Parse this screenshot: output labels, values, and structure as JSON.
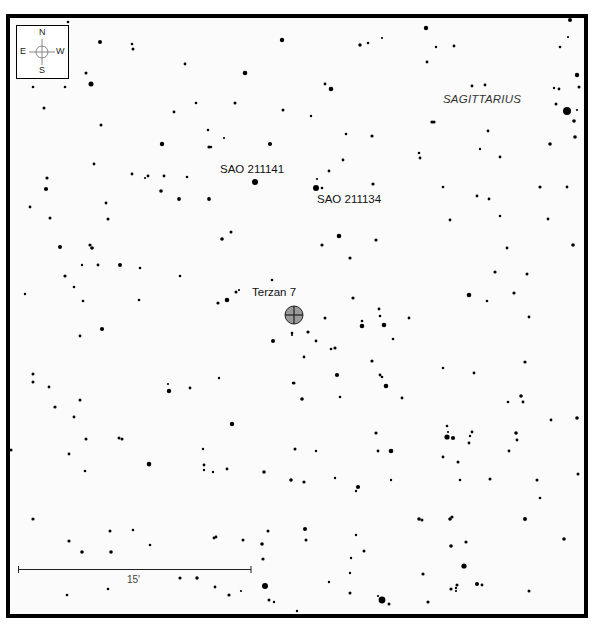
{
  "chart": {
    "constellation": "SAGITTARIUS",
    "target": {
      "name": "Terzan 7",
      "x": 294,
      "y": 315,
      "r": 9
    },
    "labels": [
      {
        "id": "sao-211141",
        "text": "SAO 211141",
        "x": 220,
        "y": 166
      },
      {
        "id": "sao-211134",
        "text": "SAO 211134",
        "x": 317,
        "y": 196
      },
      {
        "id": "terzan-7",
        "text": "Terzan 7",
        "x": 252,
        "y": 289
      }
    ],
    "constellation_label": {
      "x": 443,
      "y": 96
    },
    "compass": {
      "n": "N",
      "s": "S",
      "e": "E",
      "w": "W"
    },
    "scale": {
      "label": "15'",
      "x1": 18,
      "x2": 251,
      "y": 569
    },
    "colors": {
      "border": "#000000",
      "background": "#fbfbfb",
      "star": "#000000",
      "target_fill": "#9a9a9a"
    }
  },
  "stars": [
    [
      68,
      22,
      1.3
    ],
    [
      100,
      42,
      2
    ],
    [
      132,
      44,
      1.3
    ],
    [
      133,
      49,
      1.5
    ],
    [
      185,
      64,
      1.4
    ],
    [
      245,
      73,
      2.3
    ],
    [
      282,
      40,
      2.2
    ],
    [
      86,
      73,
      1.5
    ],
    [
      91,
      84,
      2.5
    ],
    [
      33,
      87,
      1.3
    ],
    [
      65,
      87,
      1.3
    ],
    [
      44,
      108,
      1.5
    ],
    [
      101,
      125,
      1.5
    ],
    [
      174,
      112,
      1.4
    ],
    [
      196,
      103,
      1.3
    ],
    [
      162,
      144,
      2.2
    ],
    [
      208,
      130,
      1.3
    ],
    [
      209,
      147,
      1.6
    ],
    [
      211,
      147,
      1.2
    ],
    [
      224,
      138,
      1.1
    ],
    [
      270,
      144,
      2
    ],
    [
      283,
      110,
      1.5
    ],
    [
      235,
      103,
      1.5
    ],
    [
      331,
      89,
      2.3
    ],
    [
      360,
      45,
      1.7
    ],
    [
      368,
      43,
      1.3
    ],
    [
      382,
      38,
      1.1
    ],
    [
      426,
      28,
      2.2
    ],
    [
      454,
      46,
      1.4
    ],
    [
      436,
      47,
      1.2
    ],
    [
      427,
      62,
      1.4
    ],
    [
      570,
      20,
      2
    ],
    [
      568,
      37,
      1.1
    ],
    [
      560,
      47,
      1.3
    ],
    [
      577,
      75,
      2.2
    ],
    [
      554,
      88,
      1.2
    ],
    [
      559,
      89,
      1.4
    ],
    [
      579,
      87,
      1.5
    ],
    [
      556,
      104,
      1.5
    ],
    [
      567,
      111,
      4
    ],
    [
      577,
      110,
      1.1
    ],
    [
      574,
      121,
      1.8
    ],
    [
      575,
      137,
      1.8
    ],
    [
      550,
      144,
      1.8
    ],
    [
      485,
      85,
      1.4
    ],
    [
      472,
      86,
      1.4
    ],
    [
      432,
      122,
      1.6
    ],
    [
      434,
      122,
      1.6
    ],
    [
      488,
      131,
      1.4
    ],
    [
      480,
      149,
      1.2
    ],
    [
      419,
      153,
      1.3
    ],
    [
      420,
      158,
      1.4
    ],
    [
      372,
      136,
      1.6
    ],
    [
      346,
      134,
      1.3
    ],
    [
      325,
      84,
      1.4
    ],
    [
      311,
      116,
      1.2
    ],
    [
      47,
      178,
      1.6
    ],
    [
      46,
      189,
      2.1
    ],
    [
      30,
      207,
      1.4
    ],
    [
      50,
      218,
      1.5
    ],
    [
      94,
      164,
      1.4
    ],
    [
      132,
      174,
      1.4
    ],
    [
      145,
      178,
      1.1
    ],
    [
      148,
      176,
      1.4
    ],
    [
      164,
      176,
      1.4
    ],
    [
      187,
      177,
      1.3
    ],
    [
      161,
      191,
      1.8
    ],
    [
      179,
      199,
      1.9
    ],
    [
      209,
      199,
      1.9
    ],
    [
      255,
      182,
      3
    ],
    [
      106,
      203,
      1.4
    ],
    [
      108,
      219,
      1.5
    ],
    [
      60,
      247,
      2
    ],
    [
      90,
      245,
      1.6
    ],
    [
      92,
      248,
      1.8
    ],
    [
      140,
      268,
      1.3
    ],
    [
      82,
      265,
      1.2
    ],
    [
      98,
      265,
      1.4
    ],
    [
      120,
      265,
      2
    ],
    [
      65,
      276,
      1.6
    ],
    [
      74,
      287,
      1.3
    ],
    [
      83,
      301,
      1.3
    ],
    [
      180,
      276,
      1.3
    ],
    [
      139,
      300,
      1.3
    ],
    [
      25,
      294,
      1.2
    ],
    [
      222,
      239,
      1.8
    ],
    [
      231,
      232,
      1.5
    ],
    [
      272,
      280,
      1.3
    ],
    [
      218,
      303,
      1.6
    ],
    [
      227,
      300,
      2.3
    ],
    [
      236,
      292,
      1.5
    ],
    [
      239,
      290,
      1.1
    ],
    [
      316,
      188,
      3
    ],
    [
      322,
      188,
      1.3
    ],
    [
      317,
      179,
      1.1
    ],
    [
      329,
      171,
      1.4
    ],
    [
      373,
      184,
      1.6
    ],
    [
      343,
      160,
      1.4
    ],
    [
      443,
      187,
      1.3
    ],
    [
      477,
      196,
      1.4
    ],
    [
      489,
      199,
      1.4
    ],
    [
      500,
      157,
      1.4
    ],
    [
      450,
      220,
      1.4
    ],
    [
      500,
      216,
      1.3
    ],
    [
      540,
      187,
      1.6
    ],
    [
      567,
      187,
      1.4
    ],
    [
      548,
      219,
      1.4
    ],
    [
      507,
      248,
      1.4
    ],
    [
      339,
      236,
      2.3
    ],
    [
      322,
      245,
      1.6
    ],
    [
      376,
      240,
      1.6
    ],
    [
      350,
      258,
      1.6
    ],
    [
      495,
      272,
      1.6
    ],
    [
      527,
      274,
      1.5
    ],
    [
      573,
      245,
      1.8
    ],
    [
      514,
      293,
      1.6
    ],
    [
      353,
      298,
      1.6
    ],
    [
      469,
      295,
      2.3
    ],
    [
      487,
      301,
      1.3
    ],
    [
      379,
      309,
      1.4
    ],
    [
      409,
      318,
      1.4
    ],
    [
      102,
      329,
      2.1
    ],
    [
      80,
      336,
      1.4
    ],
    [
      273,
      341,
      2
    ],
    [
      292,
      333,
      1.3
    ],
    [
      33,
      374,
      1.5
    ],
    [
      33,
      382,
      1.5
    ],
    [
      49,
      387,
      1.4
    ],
    [
      80,
      400,
      1.5
    ],
    [
      55,
      407,
      1.6
    ],
    [
      74,
      417,
      1.4
    ],
    [
      86,
      439,
      1.5
    ],
    [
      169,
      391,
      2.2
    ],
    [
      168,
      384,
      1.1
    ],
    [
      190,
      388,
      1.4
    ],
    [
      219,
      378,
      1.2
    ],
    [
      232,
      424,
      2.2
    ],
    [
      294,
      383,
      1.5
    ],
    [
      11,
      450,
      1.5
    ],
    [
      69,
      454,
      1.4
    ],
    [
      85,
      471,
      1.3
    ],
    [
      119,
      438,
      1.5
    ],
    [
      122,
      439,
      1.5
    ],
    [
      149,
      464,
      2.3
    ],
    [
      204,
      465,
      1.4
    ],
    [
      227,
      469,
      1.4
    ],
    [
      295,
      449,
      1.5
    ],
    [
      203,
      449,
      1.2
    ],
    [
      292,
      335,
      1.1
    ],
    [
      325,
      318,
      1.5
    ],
    [
      362,
      321,
      1.3
    ],
    [
      362,
      326,
      2.3
    ],
    [
      308,
      332,
      1.6
    ],
    [
      316,
      341,
      1.4
    ],
    [
      304,
      357,
      1.4
    ],
    [
      335,
      348,
      1.6
    ],
    [
      331,
      349,
      1.3
    ],
    [
      293,
      383,
      1.2
    ],
    [
      337,
      375,
      2.1
    ],
    [
      380,
      316,
      1.3
    ],
    [
      384,
      325,
      2.3
    ],
    [
      393,
      339,
      1.3
    ],
    [
      372,
      361,
      1.6
    ],
    [
      380,
      375,
      1.4
    ],
    [
      382,
      377,
      1.3
    ],
    [
      386,
      386,
      2.3
    ],
    [
      302,
      399,
      1.8
    ],
    [
      340,
      397,
      1.3
    ],
    [
      402,
      398,
      1.4
    ],
    [
      443,
      368,
      1.3
    ],
    [
      474,
      373,
      1.4
    ],
    [
      529,
      317,
      1.4
    ],
    [
      525,
      362,
      1.6
    ],
    [
      521,
      396,
      1.8
    ],
    [
      523,
      402,
      1.4
    ],
    [
      551,
      420,
      1.4
    ],
    [
      577,
      418,
      1.8
    ],
    [
      376,
      433,
      1.6
    ],
    [
      391,
      451,
      2.3
    ],
    [
      378,
      451,
      1.4
    ],
    [
      316,
      451,
      1.2
    ],
    [
      447,
      426,
      1.3
    ],
    [
      447,
      437,
      2.6
    ],
    [
      453,
      438,
      2.1
    ],
    [
      448,
      432,
      1.1
    ],
    [
      470,
      436,
      1.2
    ],
    [
      469,
      443,
      1.4
    ],
    [
      472,
      432,
      1.4
    ],
    [
      516,
      433,
      1.8
    ],
    [
      517,
      440,
      1.4
    ],
    [
      509,
      451,
      1.4
    ],
    [
      443,
      457,
      1.4
    ],
    [
      458,
      462,
      1.5
    ],
    [
      508,
      402,
      1.3
    ],
    [
      149,
      465,
      1.4
    ],
    [
      204,
      470,
      1.2
    ],
    [
      213,
      472,
      1.2
    ],
    [
      264,
      472,
      1.8
    ],
    [
      291,
      480,
      1.8
    ],
    [
      33,
      519,
      1.6
    ],
    [
      69,
      541,
      1.6
    ],
    [
      82,
      552,
      1.8
    ],
    [
      110,
      531,
      1.5
    ],
    [
      111,
      552,
      1.8
    ],
    [
      133,
      530,
      1.3
    ],
    [
      150,
      545,
      1.3
    ],
    [
      214,
      538,
      1.4
    ],
    [
      216,
      537,
      1.4
    ],
    [
      243,
      540,
      1.5
    ],
    [
      262,
      544,
      1.8
    ],
    [
      268,
      531,
      1.5
    ],
    [
      263,
      559,
      1.6
    ],
    [
      180,
      578,
      1.6
    ],
    [
      197,
      578,
      1.7
    ],
    [
      215,
      587,
      1.4
    ],
    [
      229,
      595,
      1.6
    ],
    [
      241,
      591,
      1.1
    ],
    [
      265,
      586,
      3
    ],
    [
      269,
      600,
      1.5
    ],
    [
      274,
      602,
      1.2
    ],
    [
      67,
      595,
      1.3
    ],
    [
      108,
      589,
      1.3
    ],
    [
      297,
      611,
      1.2
    ],
    [
      304,
      482,
      1.6
    ],
    [
      335,
      478,
      1.2
    ],
    [
      358,
      487,
      2.1
    ],
    [
      356,
      491,
      1.2
    ],
    [
      391,
      480,
      1.2
    ],
    [
      460,
      480,
      1.3
    ],
    [
      490,
      479,
      1.5
    ],
    [
      537,
      480,
      1.5
    ],
    [
      540,
      498,
      1.3
    ],
    [
      578,
      474,
      1.5
    ],
    [
      419,
      519,
      1.8
    ],
    [
      422,
      520,
      1.5
    ],
    [
      450,
      519,
      1.8
    ],
    [
      452,
      517,
      1.6
    ],
    [
      525,
      519,
      2
    ],
    [
      305,
      529,
      2
    ],
    [
      306,
      540,
      1.5
    ],
    [
      356,
      535,
      1.2
    ],
    [
      364,
      551,
      1.5
    ],
    [
      351,
      558,
      1.2
    ],
    [
      451,
      546,
      1.8
    ],
    [
      466,
      542,
      1.6
    ],
    [
      464,
      566,
      2.6
    ],
    [
      564,
      539,
      1.8
    ],
    [
      350,
      573,
      1.2
    ],
    [
      423,
      574,
      1.6
    ],
    [
      329,
      582,
      1.2
    ],
    [
      350,
      593,
      1.5
    ],
    [
      382,
      600,
      3.4
    ],
    [
      389,
      604,
      1.5
    ],
    [
      378,
      596,
      1.1
    ],
    [
      428,
      602,
      1.6
    ],
    [
      457,
      585,
      1.5
    ],
    [
      456,
      588,
      1.2
    ],
    [
      451,
      589,
      1.6
    ],
    [
      477,
      584,
      2
    ],
    [
      482,
      585,
      1.4
    ],
    [
      529,
      591,
      1.5
    ],
    [
      456,
      591,
      1.1
    ]
  ]
}
